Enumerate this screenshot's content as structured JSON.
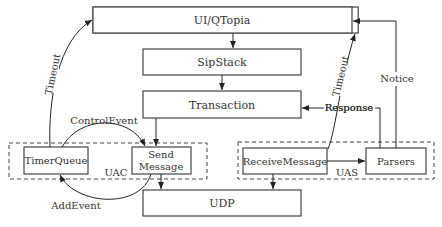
{
  "diagram": {
    "boxes": {
      "ui": "UI/QTopia",
      "sipstack": "SipStack",
      "transaction": "Transaction",
      "timerqueue": "TimerQueue",
      "send_line1": "Send",
      "send_line2": "Message",
      "receive": "ReceiveMessage",
      "parsers": "Parsers",
      "udp": "UDP"
    },
    "groups": {
      "uac": "UAC",
      "uas": "UAS"
    },
    "edges": {
      "timeout_left": "Timeout",
      "timeout_right": "Timeout",
      "control_event": "ControlEvent",
      "add_event": "AddEvent",
      "response": "Response",
      "notice": "Notice"
    },
    "colors": {
      "stroke": "#444444",
      "text": "#333333",
      "background": "#ffffff"
    }
  }
}
